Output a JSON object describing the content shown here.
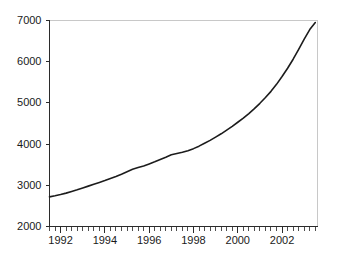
{
  "chart_data": {
    "type": "line",
    "title": "",
    "subtitle": "",
    "xlabel": "",
    "ylabel": "",
    "xlim": [
      1991.5,
      2003.6
    ],
    "ylim": [
      2000,
      7000
    ],
    "grid": false,
    "legend": false,
    "legend_position": "none",
    "x_tick_labels": [
      "1992",
      "1994",
      "1996",
      "1998",
      "2000",
      "2002"
    ],
    "x_tick_values": [
      1992,
      1994,
      1996,
      1998,
      2000,
      2002
    ],
    "x_minor_tick_interval": 0.25,
    "y_tick_labels": [
      "2000",
      "3000",
      "4000",
      "5000",
      "6000",
      "7000"
    ],
    "y_tick_values": [
      2000,
      3000,
      4000,
      5000,
      6000,
      7000
    ],
    "series": [
      {
        "name": "value",
        "color": "#1c1c1c",
        "x": [
          1991.5,
          1991.75,
          1992.0,
          1992.25,
          1992.5,
          1992.75,
          1993.0,
          1993.25,
          1993.5,
          1993.75,
          1994.0,
          1994.25,
          1994.5,
          1994.75,
          1995.0,
          1995.25,
          1995.5,
          1995.75,
          1996.0,
          1996.25,
          1996.5,
          1996.75,
          1997.0,
          1997.25,
          1997.5,
          1997.75,
          1998.0,
          1998.25,
          1998.5,
          1998.75,
          1999.0,
          1999.25,
          1999.5,
          1999.75,
          2000.0,
          2000.25,
          2000.5,
          2000.75,
          2001.0,
          2001.25,
          2001.5,
          2001.75,
          2002.0,
          2002.25,
          2002.5,
          2002.75,
          2003.0,
          2003.25,
          2003.5
        ],
        "values": [
          2720,
          2745,
          2775,
          2810,
          2850,
          2890,
          2935,
          2980,
          3025,
          3070,
          3115,
          3165,
          3215,
          3270,
          3330,
          3390,
          3430,
          3470,
          3520,
          3570,
          3625,
          3680,
          3740,
          3770,
          3800,
          3840,
          3890,
          3950,
          4020,
          4090,
          4170,
          4250,
          4340,
          4430,
          4530,
          4630,
          4740,
          4860,
          4990,
          5130,
          5280,
          5450,
          5640,
          5840,
          6060,
          6300,
          6550,
          6780,
          6950
        ]
      }
    ],
    "axis": {
      "left_color": "#2b2b2b",
      "bottom_color": "#2b2b2b",
      "top_color": "#c8c8c8",
      "right_color": "#c8c8c8"
    }
  }
}
